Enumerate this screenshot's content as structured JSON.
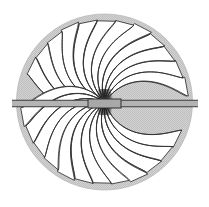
{
  "figure": {
    "width": 209,
    "height": 207,
    "background_color": "#ffffff"
  },
  "boundary_circle": {
    "name": "outer-boundary-circle",
    "center_x": 104.5,
    "center_y": 102,
    "radius": 88,
    "fill_color": "#cfcfcf",
    "stroke_color": "#b8b8b8",
    "stroke_width": 0.8
  },
  "flux_lobes": {
    "name": "flux-line-lobes",
    "count_per_half": 13,
    "line_color": "#2e2e2e",
    "line_width": 0.85,
    "fill_color": "#ffffff",
    "inner_radius": 6,
    "outer_radius": 84,
    "angle_span_deg": 180,
    "twist_deg": 46,
    "comment": "Each lobe is a petal bounded by two swept curves running from the central hub out to the boundary circle; upper and lower halves mirror across the horizontal axis"
  },
  "central_hub": {
    "name": "central-convergence-hub",
    "center_x": 104.5,
    "center_y": 102,
    "width": 13,
    "height": 26,
    "color": "#1a1a1a",
    "density_lines": 30
  },
  "conductor_rod": {
    "name": "horizontal-conductor-rod",
    "x_start": 12,
    "x_end": 198,
    "y_center": 103.5,
    "thickness": 6.5,
    "fill_color": "#b4b4b4",
    "edge_color": "#3c3c3c",
    "edge_width": 1.0,
    "comment": "Thin double-line tube spanning the full width, extending past the circle on both sides"
  },
  "center_block": {
    "name": "center-core-block",
    "x": 88,
    "y": 99,
    "width": 33,
    "height": 9,
    "fill_color": "#a8a8a8",
    "stroke_color": "#303030"
  },
  "chart_data": {
    "type": "line",
    "xlabel": "",
    "ylabel": "",
    "grid": false,
    "legend_position": "none",
    "series": [
      {
        "name": "flux-lines-upper",
        "count": 13,
        "angles_deg": [
          4,
          17,
          30,
          43,
          56,
          69,
          82,
          95,
          108,
          121,
          134,
          147,
          160
        ]
      },
      {
        "name": "flux-lines-lower",
        "count": 13,
        "angles_deg": [
          184,
          197,
          210,
          223,
          236,
          249,
          262,
          275,
          288,
          301,
          314,
          327,
          340
        ]
      }
    ]
  }
}
